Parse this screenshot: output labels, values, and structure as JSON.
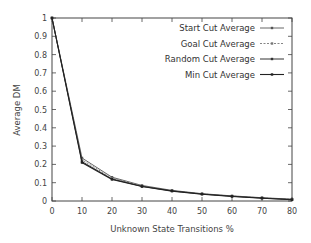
{
  "chart_data": {
    "type": "line",
    "title": "",
    "xlabel": "Unknown State Transitions %",
    "ylabel": "Average DM",
    "xlim": [
      0,
      80
    ],
    "ylim": [
      0,
      1
    ],
    "x_ticks": [
      "0",
      "10",
      "20",
      "30",
      "40",
      "50",
      "60",
      "70",
      "80"
    ],
    "y_ticks": [
      "0",
      "0.1",
      "0.2",
      "0.3",
      "0.4",
      "0.5",
      "0.6",
      "0.7",
      "0.8",
      "0.9",
      "1"
    ],
    "grid": false,
    "legend_position": "upper right",
    "x": [
      0,
      10,
      20,
      30,
      40,
      50,
      60,
      70,
      80
    ],
    "series": [
      {
        "name": "Start Cut Average",
        "values": [
          1.0,
          0.235,
          0.13,
          0.085,
          0.058,
          0.04,
          0.028,
          0.018,
          0.01
        ]
      },
      {
        "name": "Goal Cut Average",
        "values": [
          1.0,
          0.225,
          0.125,
          0.082,
          0.056,
          0.039,
          0.027,
          0.017,
          0.009
        ]
      },
      {
        "name": "Random Cut Average",
        "values": [
          1.0,
          0.215,
          0.12,
          0.08,
          0.055,
          0.038,
          0.026,
          0.016,
          0.008
        ]
      },
      {
        "name": "Min Cut Average",
        "values": [
          1.0,
          0.21,
          0.118,
          0.079,
          0.054,
          0.037,
          0.025,
          0.015,
          0.007
        ]
      }
    ]
  }
}
